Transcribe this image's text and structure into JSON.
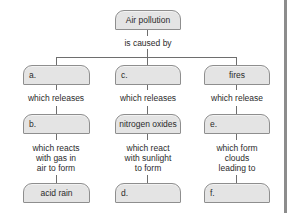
{
  "diagram": {
    "type": "concept-map",
    "root": {
      "label": "Air pollution",
      "link_label": "is caused by"
    },
    "columns": [
      {
        "level1": {
          "label": "a.",
          "is_blank": true
        },
        "link1": "which releases",
        "level2": {
          "label": "b.",
          "is_blank": true
        },
        "link2_lines": [
          "which reacts",
          "with gas in",
          "air to form"
        ],
        "level3": {
          "label": "acid rain",
          "is_blank": false
        }
      },
      {
        "level1": {
          "label": "c.",
          "is_blank": true
        },
        "link1": "which releases",
        "level2": {
          "label": "nitrogen oxides",
          "is_blank": false
        },
        "link2_lines": [
          "which react",
          "with sunlight",
          "to form"
        ],
        "level3": {
          "label": "d.",
          "is_blank": true
        }
      },
      {
        "level1": {
          "label": "fires",
          "is_blank": false
        },
        "link1": "which release",
        "level2": {
          "label": "e.",
          "is_blank": true
        },
        "link2_lines": [
          "which form",
          "clouds",
          "leading to"
        ],
        "level3": {
          "label": "f.",
          "is_blank": true
        }
      }
    ]
  },
  "colors": {
    "node_fill": "#e4e4e4",
    "node_border": "#8e8e8e",
    "connector": "#6e6e6e",
    "text": "#2b2b2b",
    "page_edge": "#8c8c8c"
  }
}
